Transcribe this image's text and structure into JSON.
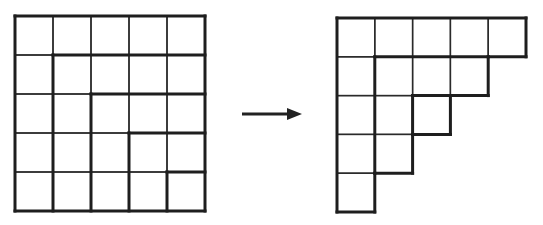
{
  "colors": {
    "filled": "#d4d4d4",
    "empty": "#ffffff",
    "line": "#1e1e1e"
  },
  "left_grid": {
    "name": "square-grid-with-hooks",
    "rows": 5,
    "cols": 5,
    "origin": [
      15,
      16
    ],
    "cell": [
      38,
      39
    ],
    "filled": [
      [
        1,
        1,
        1,
        1,
        1
      ],
      [
        1,
        0,
        0,
        0,
        0
      ],
      [
        1,
        0,
        1,
        1,
        1
      ],
      [
        1,
        0,
        1,
        0,
        0
      ],
      [
        1,
        0,
        1,
        0,
        1
      ]
    ],
    "thick_segments": [
      [
        0,
        0,
        5,
        0
      ],
      [
        0,
        0,
        0,
        5
      ],
      [
        5,
        0,
        5,
        5
      ],
      [
        0,
        5,
        5,
        5
      ],
      [
        1,
        1,
        5,
        1
      ],
      [
        1,
        1,
        1,
        5
      ],
      [
        2,
        2,
        5,
        2
      ],
      [
        2,
        2,
        2,
        5
      ],
      [
        3,
        3,
        5,
        3
      ],
      [
        3,
        3,
        3,
        5
      ],
      [
        4,
        4,
        5,
        4
      ],
      [
        4,
        4,
        4,
        5
      ]
    ]
  },
  "arrow": {
    "name": "transform-arrow",
    "from": [
      242,
      114
    ],
    "to": [
      302,
      114
    ]
  },
  "right_grid": {
    "name": "staircase-diagram",
    "origin": [
      337,
      18
    ],
    "cell": [
      37.8,
      38.8
    ],
    "row_lengths": [
      5,
      4,
      3,
      2,
      1
    ],
    "thick_segments": [
      [
        0,
        0,
        5,
        0
      ],
      [
        0,
        0,
        0,
        5
      ],
      [
        5,
        0,
        5,
        1
      ],
      [
        4,
        1,
        5,
        1
      ],
      [
        4,
        1,
        4,
        2
      ],
      [
        3,
        2,
        4,
        2
      ],
      [
        3,
        2,
        3,
        3
      ],
      [
        2,
        3,
        3,
        3
      ],
      [
        2,
        3,
        2,
        4
      ],
      [
        1,
        4,
        2,
        4
      ],
      [
        1,
        4,
        1,
        5
      ],
      [
        0,
        5,
        1,
        5
      ],
      [
        1,
        1,
        4,
        1
      ],
      [
        1,
        1,
        1,
        4
      ],
      [
        2,
        2,
        3,
        2
      ],
      [
        2,
        2,
        2,
        3
      ]
    ]
  }
}
